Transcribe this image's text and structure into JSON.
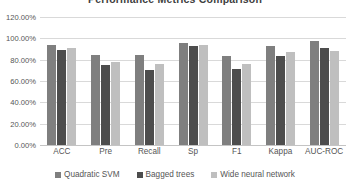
{
  "chart_data": {
    "type": "bar",
    "title": "Performance Metrics Comparison",
    "xlabel": "",
    "ylabel": "",
    "ylim": [
      0,
      120
    ],
    "grid": true,
    "legend_position": "bottom",
    "y_tick_labels": [
      "120.00%",
      "100.00%",
      "80.00%",
      "60.00%",
      "40.00%",
      "20.00%",
      "0.00%"
    ],
    "y_tick_values": [
      120,
      100,
      80,
      60,
      40,
      20,
      0
    ],
    "categories": [
      "ACC",
      "Pre",
      "Recall",
      "Sp",
      "F1",
      "Kappa",
      "AUC-ROC"
    ],
    "series": [
      {
        "name": "Quadratic SVM",
        "color": "#7f7f7f",
        "values": [
          94.0,
          84.3,
          84.3,
          96.1,
          83.8,
          92.5,
          97.5
        ]
      },
      {
        "name": "Bagged trees",
        "color": "#4d4d4d",
        "values": [
          88.7,
          75.0,
          70.2,
          93.0,
          71.4,
          83.2,
          91.0
        ]
      },
      {
        "name": "Wide neural network",
        "color": "#bfbfbf",
        "values": [
          91.0,
          78.0,
          76.0,
          94.0,
          75.8,
          87.4,
          88.3
        ]
      }
    ]
  }
}
